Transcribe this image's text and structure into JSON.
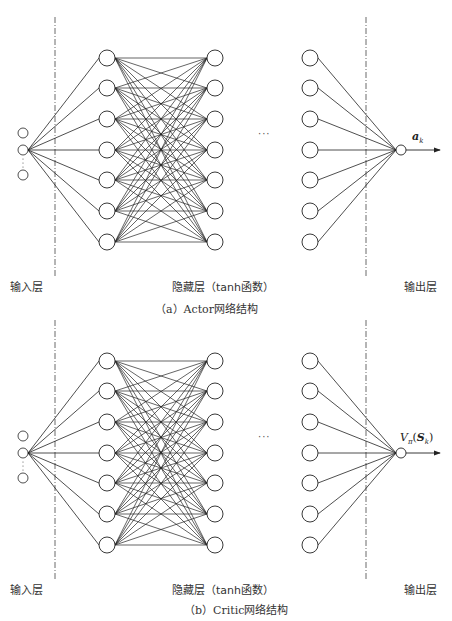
{
  "colors": {
    "line": "#222222",
    "node_fill": "#ffffff",
    "dash": "#444444",
    "background": "#ffffff"
  },
  "diagrams": [
    {
      "id": "actor",
      "offset_y": 0,
      "input_label": "输入层",
      "hidden_label": "隐藏层（tanh函数）",
      "output_label": "输出层",
      "output_symbol": "a",
      "output_subscript": "k",
      "caption": "（a）Actor网络结构",
      "hidden_ellipsis": "···"
    },
    {
      "id": "critic",
      "offset_y": 303,
      "input_label": "输入层",
      "hidden_label": "隐藏层（tanh函数）",
      "output_label": "输出层",
      "output_symbol": "V",
      "output_subscript": "π",
      "output_arg": "S",
      "output_arg_subscript": "k",
      "caption": "（b）Critic网络结构",
      "hidden_ellipsis": "···"
    }
  ],
  "network": {
    "input_nodes_y": [
      133,
      150,
      175
    ],
    "input_x": 23,
    "hidden_layers_x": [
      107,
      215,
      310
    ],
    "hidden_nodes_y": [
      58,
      88,
      119,
      150,
      180,
      211,
      242
    ],
    "output_x": 401,
    "output_y": 150,
    "arrow_end_x": 440,
    "dash_lines_x": [
      55,
      366
    ],
    "dash_y": [
      17,
      278
    ],
    "node_r_hidden": 8,
    "node_r_io": 5
  }
}
